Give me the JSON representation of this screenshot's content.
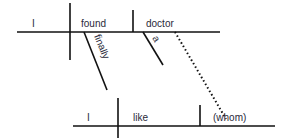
{
  "diagram": {
    "type": "sentence-diagram",
    "main_clause": {
      "subject": "I",
      "verb": "found",
      "object": "doctor",
      "modifiers": {
        "verb_adverb": "finally",
        "object_article": "a"
      }
    },
    "relative_clause": {
      "subject": "I",
      "verb": "like",
      "object": "(whom)"
    },
    "connector": "dotted line from doctor to (whom)"
  },
  "colors": {
    "line": "#111111",
    "text": "#2a2a3a",
    "background": "#ffffff"
  }
}
